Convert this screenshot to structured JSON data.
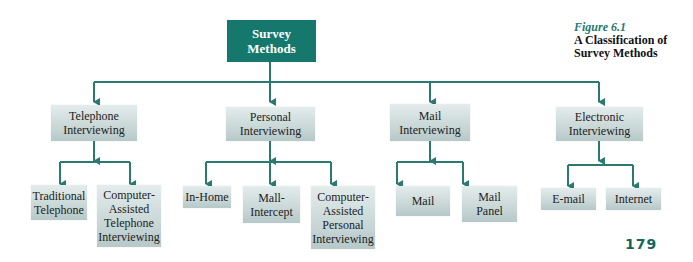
{
  "figure": {
    "number": "Figure 6.1",
    "title": "A Classification of Survey Methods",
    "page_number": "179"
  },
  "colors": {
    "root_fill": "#16786c",
    "connector": "#2b7a72",
    "node_fill_top": "#e4ecec",
    "node_fill_bottom": "#b6c8c8",
    "figure_number": "#1f7a70",
    "page_number": "#16655c"
  },
  "root": {
    "label": "Survey\nMethods"
  },
  "categories": [
    {
      "label": "Telephone\nInterviewing",
      "children": [
        {
          "label": "Traditional\nTelephone"
        },
        {
          "label": "Computer-\nAssisted\nTelephone\nInterviewing"
        }
      ]
    },
    {
      "label": "Personal\nInterviewing",
      "children": [
        {
          "label": "In-Home"
        },
        {
          "label": "Mall-\nIntercept"
        },
        {
          "label": "Computer-\nAssisted\nPersonal\nInterviewing"
        }
      ]
    },
    {
      "label": "Mail\nInterviewing",
      "children": [
        {
          "label": "Mail"
        },
        {
          "label": "Mail\nPanel"
        }
      ]
    },
    {
      "label": "Electronic\nInterviewing",
      "children": [
        {
          "label": "E-mail"
        },
        {
          "label": "Internet"
        }
      ]
    }
  ]
}
